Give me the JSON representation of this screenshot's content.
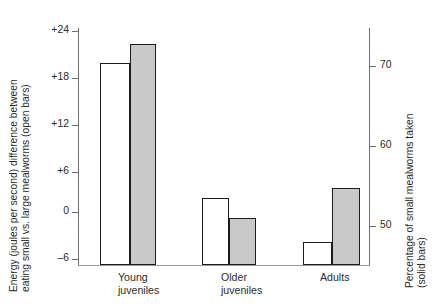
{
  "chart_data": {
    "type": "bar",
    "title": "",
    "subtitle": "",
    "categories": [
      "Young juveniles",
      "Older juveniles",
      "Adults"
    ],
    "category_lines": [
      [
        "Young",
        "juveniles"
      ],
      [
        "Older",
        "juveniles"
      ],
      [
        "Adults"
      ]
    ],
    "series": [
      {
        "name": "Energy (joules per second) difference between eating small vs. large mealworms (open bars)",
        "short_name": "Energy difference (open bars)",
        "axis": "left",
        "style": "open",
        "fill": "#ffffff",
        "edge": "#1c1c1c",
        "values": [
          19.8,
          2.0,
          -3.7
        ]
      },
      {
        "name": "Percentage of small mealworms taken (solid bars)",
        "short_name": "Percentage small taken (solid bars)",
        "axis": "right",
        "style": "solid",
        "fill": "#c9c9c9",
        "edge": "#1c1c1c",
        "values": [
          72.8,
          51.0,
          54.8
        ]
      }
    ],
    "left_axis": {
      "label_lines": [
        "Energy (joules per second) difference between",
        "eating small vs. large mealworms (open bars)"
      ],
      "ticks": [
        "+24",
        "+18",
        "+12",
        "+6",
        "0",
        "–6"
      ],
      "tick_values": [
        24,
        18,
        12,
        6,
        0,
        -6
      ],
      "ylim": [
        -7.5,
        26.5
      ]
    },
    "right_axis": {
      "label_lines": [
        "Percentage of small mealworms taken",
        "(solid bars)"
      ],
      "ticks": [
        "70",
        "60",
        "50"
      ],
      "tick_values": [
        70,
        60,
        50
      ],
      "ylim": [
        45.1,
        74.9
      ]
    },
    "xlabel": "",
    "grid": false,
    "legend": "none (encoded in axis titles: open bars = left axis, solid bars = right axis)"
  },
  "colors": {
    "background": "#ffffff",
    "axis": "#6e6e6e",
    "baseline": "#9a9a9a",
    "bar_edge": "#1c1c1c",
    "bar_solid_fill": "#c9c9c9",
    "bar_open_fill": "#ffffff",
    "text": "#2b2b2b"
  }
}
